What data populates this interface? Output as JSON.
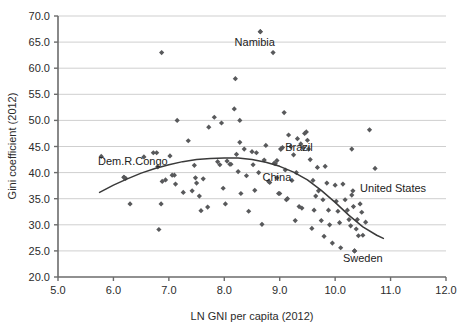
{
  "chart_data": {
    "type": "scatter",
    "title": "",
    "xlabel": "LN GNI per capita (2012)",
    "ylabel": "Gini coefficient (2012)",
    "xlim": [
      5.0,
      12.0
    ],
    "ylim": [
      20.0,
      70.0
    ],
    "xticks": [
      "5.0",
      "6.0",
      "7.0",
      "8.0",
      "9.0",
      "10.0",
      "11.0",
      "12.0"
    ],
    "yticks": [
      "20.0",
      "25.0",
      "30.0",
      "35.0",
      "40.0",
      "45.0",
      "50.0",
      "55.0",
      "60.0",
      "65.0",
      "70.0"
    ],
    "grid": "horizontal",
    "legend": "none",
    "marker": "diamond",
    "marker_color": "#58595b",
    "trend_color": "#3a3a3a",
    "gridline_color": "#cfcfcf",
    "axis_color": "#6b6b6b",
    "points": [
      [
        5.78,
        43.1
      ],
      [
        6.19,
        39.1
      ],
      [
        6.22,
        38.9
      ],
      [
        6.3,
        34.0
      ],
      [
        6.55,
        43.0
      ],
      [
        6.72,
        43.8
      ],
      [
        6.78,
        43.8
      ],
      [
        6.8,
        41.1
      ],
      [
        6.82,
        29.1
      ],
      [
        6.86,
        34.0
      ],
      [
        6.87,
        63.0
      ],
      [
        6.88,
        38.3
      ],
      [
        6.94,
        38.6
      ],
      [
        7.02,
        43.2
      ],
      [
        7.06,
        39.5
      ],
      [
        7.1,
        39.5
      ],
      [
        7.12,
        37.8
      ],
      [
        7.15,
        50.0
      ],
      [
        7.26,
        36.2
      ],
      [
        7.35,
        46.1
      ],
      [
        7.42,
        36.5
      ],
      [
        7.46,
        41.4
      ],
      [
        7.48,
        39.0
      ],
      [
        7.5,
        38.0
      ],
      [
        7.55,
        35.5
      ],
      [
        7.58,
        32.7
      ],
      [
        7.62,
        38.8
      ],
      [
        7.7,
        33.4
      ],
      [
        7.72,
        48.7
      ],
      [
        7.82,
        50.6
      ],
      [
        7.88,
        42.1
      ],
      [
        7.92,
        41.5
      ],
      [
        7.95,
        49.5
      ],
      [
        7.98,
        37.0
      ],
      [
        8.02,
        34.0
      ],
      [
        8.05,
        42.2
      ],
      [
        8.1,
        41.6
      ],
      [
        8.12,
        41.6
      ],
      [
        8.18,
        52.2
      ],
      [
        8.2,
        58.0
      ],
      [
        8.22,
        43.5
      ],
      [
        8.25,
        40.2
      ],
      [
        8.28,
        50.0
      ],
      [
        8.3,
        36.0
      ],
      [
        8.36,
        44.5
      ],
      [
        8.4,
        39.4
      ],
      [
        8.44,
        32.6
      ],
      [
        8.5,
        44.0
      ],
      [
        8.52,
        41.5
      ],
      [
        8.55,
        36.6
      ],
      [
        8.58,
        43.8
      ],
      [
        8.62,
        40.0
      ],
      [
        8.65,
        67.0
      ],
      [
        8.68,
        30.1
      ],
      [
        8.72,
        42.4
      ],
      [
        8.75,
        45.2
      ],
      [
        8.8,
        38.3
      ],
      [
        8.82,
        38.1
      ],
      [
        8.88,
        63.0
      ],
      [
        8.9,
        41.8
      ],
      [
        8.92,
        41.7
      ],
      [
        8.95,
        42.3
      ],
      [
        8.98,
        36.0
      ],
      [
        9.0,
        36.0
      ],
      [
        9.02,
        44.5
      ],
      [
        9.05,
        44.8
      ],
      [
        9.08,
        51.5
      ],
      [
        9.1,
        40.5
      ],
      [
        9.12,
        34.8
      ],
      [
        9.14,
        35.0
      ],
      [
        9.16,
        47.2
      ],
      [
        9.2,
        45.0
      ],
      [
        9.22,
        38.5
      ],
      [
        9.25,
        43.4
      ],
      [
        9.28,
        30.8
      ],
      [
        9.3,
        40.0
      ],
      [
        9.32,
        46.5
      ],
      [
        9.35,
        33.5
      ],
      [
        9.38,
        45.5
      ],
      [
        9.4,
        33.2
      ],
      [
        9.42,
        44.8
      ],
      [
        9.45,
        47.5
      ],
      [
        9.48,
        47.8
      ],
      [
        9.5,
        46.2
      ],
      [
        9.52,
        44.5
      ],
      [
        9.55,
        42.5
      ],
      [
        9.58,
        29.3
      ],
      [
        9.6,
        38.5
      ],
      [
        9.62,
        32.8
      ],
      [
        9.65,
        35.5
      ],
      [
        9.68,
        41.0
      ],
      [
        9.7,
        36.5
      ],
      [
        9.75,
        30.8
      ],
      [
        9.78,
        34.8
      ],
      [
        9.8,
        27.8
      ],
      [
        9.82,
        41.2
      ],
      [
        9.85,
        38.0
      ],
      [
        9.88,
        32.8
      ],
      [
        9.9,
        30.0
      ],
      [
        9.95,
        26.5
      ],
      [
        10.0,
        37.6
      ],
      [
        10.02,
        34.5
      ],
      [
        10.05,
        32.6
      ],
      [
        10.08,
        30.4
      ],
      [
        10.1,
        25.6
      ],
      [
        10.14,
        37.8
      ],
      [
        10.18,
        34.8
      ],
      [
        10.22,
        32.8
      ],
      [
        10.25,
        31.0
      ],
      [
        10.28,
        29.8
      ],
      [
        10.3,
        35.7
      ],
      [
        10.33,
        33.5
      ],
      [
        10.35,
        25.0
      ],
      [
        10.38,
        29.2
      ],
      [
        10.4,
        31.0
      ],
      [
        10.42,
        27.9
      ],
      [
        10.45,
        34.0
      ],
      [
        10.48,
        32.4
      ],
      [
        10.5,
        28.0
      ],
      [
        10.55,
        30.5
      ],
      [
        10.62,
        48.2
      ],
      [
        10.72,
        40.8
      ],
      [
        10.3,
        44.5
      ],
      [
        8.28,
        45.8
      ]
    ],
    "annotations": [
      {
        "name": "Namibia",
        "label": "Namibia",
        "x": 8.65,
        "y": 67.0,
        "label_x": 8.55,
        "label_y": 64.2,
        "anchor": "middle"
      },
      {
        "name": "Brazil",
        "label": "Brazil",
        "x": 9.02,
        "y": 44.5,
        "label_x": 9.1,
        "label_y": 44.2,
        "anchor": "start"
      },
      {
        "name": "China",
        "label": "China",
        "x": 8.95,
        "y": 39.0,
        "label_x": 8.95,
        "label_y": 38.4,
        "anchor": "middle"
      },
      {
        "name": "Dem.R.Congo",
        "label": "Dem.R.Congo",
        "x": 6.19,
        "y": 39.1,
        "label_x": 6.35,
        "label_y": 41.4,
        "anchor": "middle"
      },
      {
        "name": "United States",
        "label": "United States",
        "x": 10.32,
        "y": 36.5,
        "label_x": 10.45,
        "label_y": 36.2,
        "anchor": "start"
      },
      {
        "name": "Sweden",
        "label": "Sweden",
        "x": 10.35,
        "y": 25.0,
        "label_x": 10.5,
        "label_y": 22.8,
        "anchor": "middle"
      }
    ],
    "trend_curve": [
      [
        5.75,
        36.2
      ],
      [
        6.0,
        37.6
      ],
      [
        6.25,
        38.8
      ],
      [
        6.5,
        39.9
      ],
      [
        6.75,
        40.8
      ],
      [
        7.0,
        41.5
      ],
      [
        7.25,
        42.1
      ],
      [
        7.5,
        42.5
      ],
      [
        7.75,
        42.7
      ],
      [
        8.0,
        42.8
      ],
      [
        8.25,
        42.8
      ],
      [
        8.5,
        42.5
      ],
      [
        8.75,
        42.0
      ],
      [
        9.0,
        41.2
      ],
      [
        9.25,
        40.1
      ],
      [
        9.5,
        38.6
      ],
      [
        9.75,
        36.6
      ],
      [
        10.0,
        34.3
      ],
      [
        10.25,
        31.8
      ],
      [
        10.5,
        29.6
      ],
      [
        10.75,
        28.0
      ],
      [
        10.87,
        27.4
      ]
    ]
  }
}
